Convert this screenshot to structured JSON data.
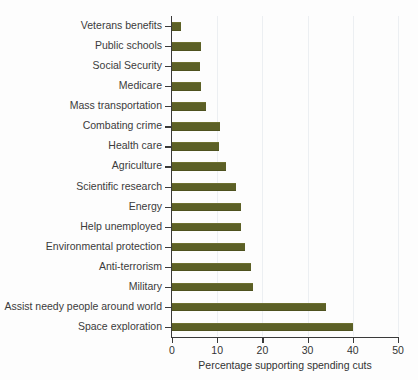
{
  "chart_data": {
    "type": "bar",
    "orientation": "horizontal",
    "title": "",
    "subtitle": "",
    "xlabel": "Percentage supporting spending cuts",
    "ylabel": "",
    "xlim": [
      0,
      50
    ],
    "xticks": [
      0,
      10,
      20,
      30,
      40,
      50
    ],
    "xtick_labels": [
      "0",
      "10",
      "20",
      "30",
      "40",
      "50"
    ],
    "grid": "vertical-light",
    "legend": "none",
    "bar_color": "#5c6026",
    "axis_color": "#3a3a3a",
    "label_color": "#3b3b3b",
    "gridline_color": "#eceff2",
    "categories": [
      "Veterans benefits",
      "Public schools",
      "Social Security",
      "Medicare",
      "Mass transportation",
      "Combating crime",
      "Health care",
      "Agriculture",
      "Scientific research",
      "Energy",
      "Help unemployed",
      "Environmental protection",
      "Anti-terrorism",
      "Military",
      "Assist needy people around world",
      "Space exploration"
    ],
    "values": [
      2.0,
      6.5,
      6.3,
      6.5,
      7.6,
      10.6,
      10.3,
      12.0,
      14.1,
      15.2,
      15.3,
      16.2,
      17.5,
      18.0,
      34.0,
      40.0
    ]
  }
}
